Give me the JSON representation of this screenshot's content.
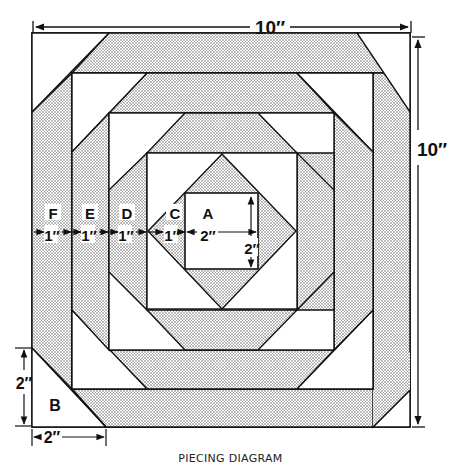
{
  "diagram": {
    "type": "quilt-block-piecing",
    "caption": "PIECING DIAGRAM",
    "overall_width": "10″",
    "overall_height": "10″",
    "pieces": {
      "A": {
        "label": "A",
        "width": "2″",
        "height": "2″"
      },
      "B": {
        "label": "B",
        "width": "2″",
        "height": "2″"
      },
      "C": {
        "label": "C",
        "strip": "1″"
      },
      "D": {
        "label": "D",
        "strip": "1″"
      },
      "E": {
        "label": "E",
        "strip": "1″"
      },
      "F": {
        "label": "F",
        "strip": "1″"
      }
    },
    "colors": {
      "line": "#111111",
      "shade_dot": "#555555",
      "background": "#ffffff"
    }
  }
}
